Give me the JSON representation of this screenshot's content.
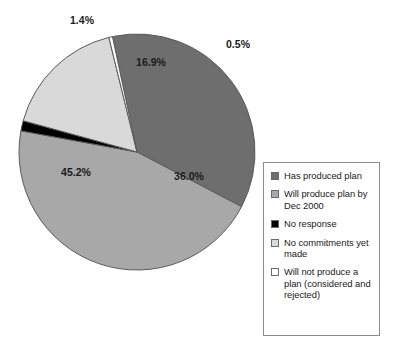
{
  "chart_data": {
    "type": "pie",
    "title": "",
    "subtitle": "",
    "xlabel": "",
    "ylabel": "",
    "grid": false,
    "legend_position": "right",
    "units": "percent",
    "start_angle_deg": -12,
    "direction": "clockwise",
    "center": {
      "x": 137,
      "y": 152
    },
    "radius": 118,
    "categories": [
      "Has produced plan",
      "Will produce plan by Dec 2000",
      "No response",
      "No commitments yet made",
      "Will not produce a plan (considered and rejected)"
    ],
    "values": [
      36.0,
      45.2,
      1.4,
      16.9,
      0.5
    ],
    "labels": [
      "36.0%",
      "45.2%",
      "1.4%",
      "16.9%",
      "0.5%"
    ],
    "colors": [
      "#6e6e6e",
      "#a8a8a8",
      "#000000",
      "#d9d9d9",
      "#ffffff"
    ],
    "slices": [
      {
        "name": "Has produced plan",
        "value": 36.0,
        "label": "36.0%",
        "color": "#6e6e6e",
        "label_x": 189,
        "label_y": 177,
        "label_outside": false
      },
      {
        "name": "Will produce plan by Dec 2000",
        "value": 45.2,
        "label": "45.2%",
        "color": "#a8a8a8",
        "label_x": 76,
        "label_y": 173,
        "label_outside": false
      },
      {
        "name": "No response",
        "value": 1.4,
        "label": "1.4%",
        "color": "#000000",
        "label_x": 82,
        "label_y": 21,
        "label_outside": true
      },
      {
        "name": "No commitments yet made",
        "value": 16.9,
        "label": "16.9%",
        "color": "#d9d9d9",
        "label_x": 151,
        "label_y": 63,
        "label_outside": false
      },
      {
        "name": "Will not produce a plan (considered and rejected)",
        "value": 0.5,
        "label": "0.5%",
        "color": "#ffffff",
        "label_x": 238,
        "label_y": 45,
        "label_outside": true
      }
    ]
  },
  "legend": {
    "items": [
      {
        "label": "Has produced plan",
        "color": "#6e6e6e"
      },
      {
        "label": "Will produce plan by Dec 2000",
        "color": "#a8a8a8"
      },
      {
        "label": "No response",
        "color": "#000000"
      },
      {
        "label": "No commitments yet made",
        "color": "#d9d9d9"
      },
      {
        "label": "Will not produce a plan (considered and rejected)",
        "color": "#ffffff"
      }
    ]
  },
  "theme": {
    "background": "#ffffff",
    "slice_outline": "#5a5a5a",
    "legend_border": "#8c8c8c",
    "text": "#1a1a1a"
  }
}
